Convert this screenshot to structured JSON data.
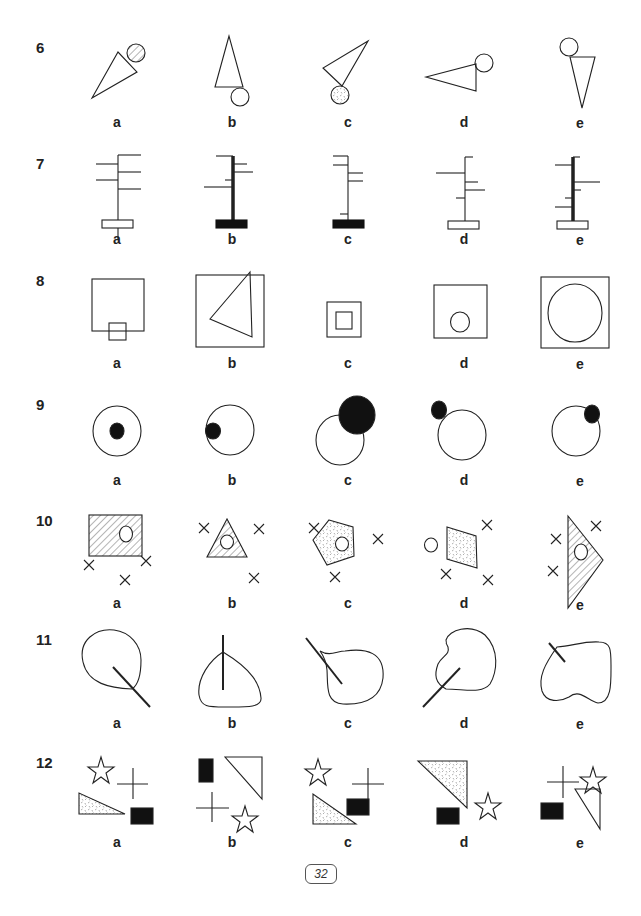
{
  "page": {
    "page_number": "32",
    "option_letters": [
      "a",
      "b",
      "c",
      "d",
      "e"
    ]
  },
  "questions": [
    {
      "number": "6",
      "options": [
        {
          "label": "a",
          "description": "triangle pointing lower-left with hatched circle at top-right"
        },
        {
          "label": "b",
          "description": "tall triangle pointing up with circle at bottom-right"
        },
        {
          "label": "c",
          "description": "triangle pointing upper-right with dotted circle at bottom"
        },
        {
          "label": "d",
          "description": "triangle pointing left with circle at top-right"
        },
        {
          "label": "e",
          "description": "triangle pointing down with circle at top-left"
        }
      ]
    },
    {
      "number": "7",
      "options": [
        {
          "label": "a",
          "description": "thin pole, white base, branches alternating"
        },
        {
          "label": "b",
          "description": "thick pole, black base"
        },
        {
          "label": "c",
          "description": "thin pole, black base"
        },
        {
          "label": "d",
          "description": "thin pole, white base"
        },
        {
          "label": "e",
          "description": "thick pole, white base"
        }
      ]
    },
    {
      "number": "8",
      "options": [
        {
          "label": "a",
          "description": "square with small square overlapping bottom edge"
        },
        {
          "label": "b",
          "description": "square containing triangle"
        },
        {
          "label": "c",
          "description": "square containing smaller square"
        },
        {
          "label": "d",
          "description": "square containing small circle"
        },
        {
          "label": "e",
          "description": "square containing large circle"
        }
      ]
    },
    {
      "number": "9",
      "options": [
        {
          "label": "a",
          "description": "circle with black dot at center"
        },
        {
          "label": "b",
          "description": "circle with black dot on left inner edge"
        },
        {
          "label": "c",
          "description": "circle overlapped by large black circle"
        },
        {
          "label": "d",
          "description": "circle with black dot outside top-left"
        },
        {
          "label": "e",
          "description": "circle with black dot on top-right edge"
        }
      ]
    },
    {
      "number": "10",
      "options": [
        {
          "label": "a",
          "description": "hatched rectangle with circle, three crosses"
        },
        {
          "label": "b",
          "description": "hatched triangle with circle, three crosses"
        },
        {
          "label": "c",
          "description": "dotted pentagon with circle, three crosses"
        },
        {
          "label": "d",
          "description": "dotted quadrilateral, circle outside, three crosses"
        },
        {
          "label": "e",
          "description": "hatched triangle with circle, three crosses"
        }
      ]
    },
    {
      "number": "11",
      "options": [
        {
          "label": "a",
          "description": "blob with line exiting lower-right"
        },
        {
          "label": "b",
          "description": "leaf shape with vertical line"
        },
        {
          "label": "c",
          "description": "blob with line at upper-left"
        },
        {
          "label": "d",
          "description": "blob with line exiting lower-left"
        },
        {
          "label": "e",
          "description": "heart-like blob with short line at top-left"
        }
      ]
    },
    {
      "number": "12",
      "options": [
        {
          "label": "a",
          "description": "star, cross, dotted triangle, black rectangle"
        },
        {
          "label": "b",
          "description": "black rectangle, triangle, cross, star"
        },
        {
          "label": "c",
          "description": "star, cross, dotted triangle, black rectangle"
        },
        {
          "label": "d",
          "description": "dotted triangle, black rectangle, star"
        },
        {
          "label": "e",
          "description": "cross, star, black rectangle, triangle"
        }
      ]
    }
  ],
  "colors": {
    "ink": "#222222",
    "background": "#ffffff"
  }
}
